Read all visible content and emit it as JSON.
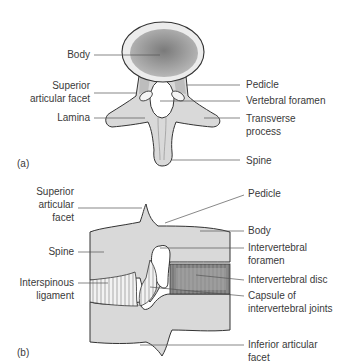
{
  "panel_a": {
    "tag": "(a)",
    "title": "Vertebra, superior view",
    "labels": {
      "body": "Body",
      "superior_articular_facet_1": "Superior",
      "superior_articular_facet_2": "articular facet",
      "lamina": "Lamina",
      "pedicle": "Pedicle",
      "vertebral_foramen": "Vertebral foramen",
      "transverse_process_1": "Transverse",
      "transverse_process_2": "process",
      "spine": "Spine"
    }
  },
  "panel_b": {
    "tag": "(b)",
    "title": "Two vertebrae, lateral view",
    "labels": {
      "superior_articular_facet_1": "Superior",
      "superior_articular_facet_2": "articular",
      "superior_articular_facet_3": "facet",
      "spine": "Spine",
      "interspinous_ligament_1": "Interspinous",
      "interspinous_ligament_2": "ligament",
      "pedicle": "Pedicle",
      "body": "Body",
      "intervertebral_foramen_1": "Intervertebral",
      "intervertebral_foramen_2": "foramen",
      "intervertebral_disc": "Intervertebral disc",
      "capsule_1": "Capsule of",
      "capsule_2": "intervertebral joints",
      "inferior_articular_facet_1": "Inferior articular",
      "inferior_articular_facet_2": "facet"
    }
  },
  "colors": {
    "bone": "#d9d9d9",
    "outline": "#333333",
    "body_dark": "#8f8f8f",
    "leader": "#555555"
  }
}
